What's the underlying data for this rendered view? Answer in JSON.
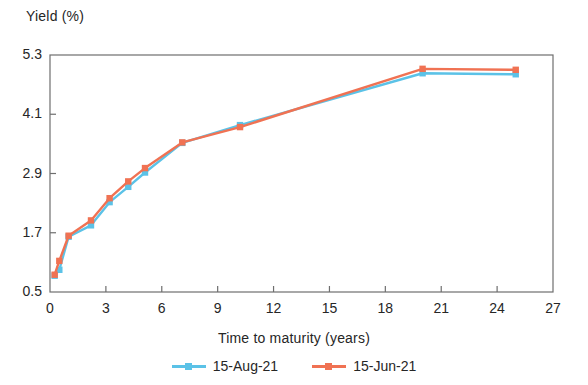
{
  "chart_data": {
    "type": "line",
    "title": "",
    "xlabel": "Time to maturity (years)",
    "ylabel": "Yield (%)",
    "xlim": [
      0,
      27
    ],
    "ylim": [
      0.5,
      5.3
    ],
    "xticks": [
      "0",
      "3",
      "6",
      "9",
      "12",
      "15",
      "18",
      "21",
      "24",
      "27"
    ],
    "yticks": [
      "5.3",
      "4.1",
      "2.9",
      "1.7",
      "0.5"
    ],
    "grid": false,
    "legend_position": "bottom",
    "marker": "square",
    "series": [
      {
        "name": "15-Aug-21",
        "color": "#5BC2E7",
        "x": [
          0.25,
          0.5,
          1.0,
          2.2,
          3.2,
          4.2,
          5.1,
          7.1,
          10.2,
          20.0,
          25.0
        ],
        "values": [
          0.83,
          0.95,
          1.62,
          1.85,
          2.32,
          2.63,
          2.92,
          3.52,
          3.88,
          4.93,
          4.91
        ]
      },
      {
        "name": "15-Jun-21",
        "color": "#F07253",
        "x": [
          0.25,
          0.5,
          1.0,
          2.2,
          3.2,
          4.2,
          5.1,
          7.1,
          10.2,
          20.0,
          25.0
        ],
        "values": [
          0.85,
          1.13,
          1.64,
          1.95,
          2.4,
          2.74,
          3.01,
          3.53,
          3.84,
          5.02,
          5.0
        ]
      }
    ]
  },
  "legend": {
    "items": [
      {
        "label": "15-Aug-21",
        "color": "#5BC2E7"
      },
      {
        "label": "15-Jun-21",
        "color": "#F07253"
      }
    ]
  },
  "axes": {
    "frame_color": "#6e6e6e"
  }
}
